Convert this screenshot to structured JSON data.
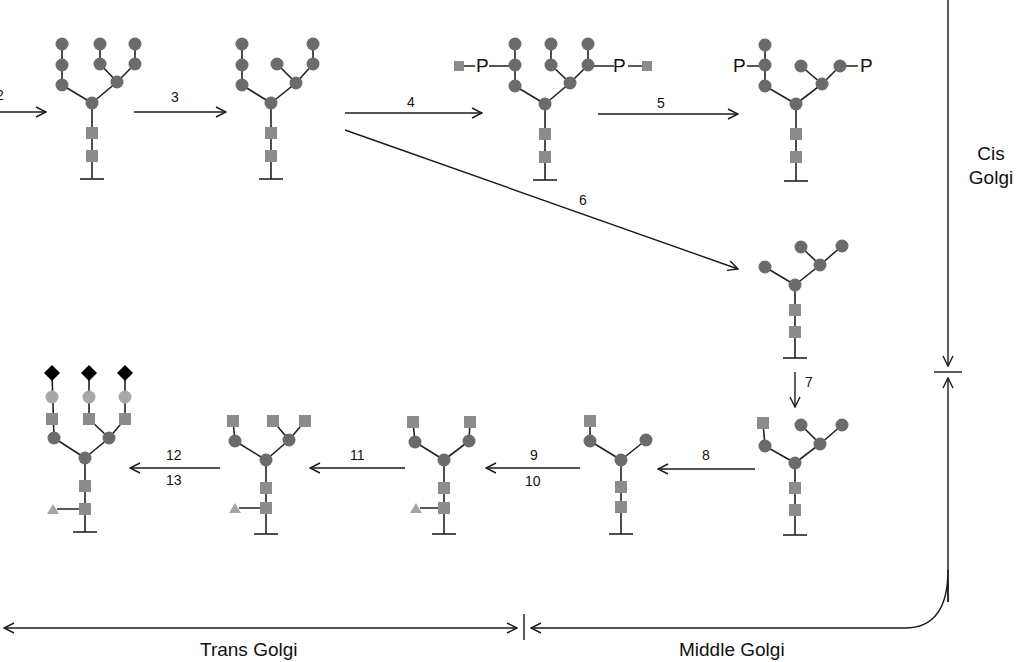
{
  "figure": {
    "colors": {
      "mannose_circle": "#6b6b6b",
      "glcnac_square": "#8c8c8c",
      "galactose_circle_light": "#a8a8a8",
      "sialic_acid_diamond": "#000000",
      "fucose_triangle": "#a5a5a5",
      "line": "#222222"
    }
  },
  "steps": {
    "s2": "2",
    "s3": "3",
    "s4": "4",
    "s5": "5",
    "s6": "6",
    "s7": "7",
    "s8": "8",
    "s9": "9",
    "s10": "10",
    "s11": "11",
    "s12": "12",
    "s13": "13"
  },
  "phosphate_label": "P",
  "regions": {
    "cis_line1": "Cis",
    "cis_line2": "Golgi",
    "middle": "Middle Golgi",
    "trans": "Trans Golgi"
  },
  "structures": [
    {
      "id": "A",
      "description": "high-mannose (Man8) after step 2"
    },
    {
      "id": "B",
      "description": "Man7 after step 3"
    },
    {
      "id": "C",
      "description": "GlcNAc-phosphate added to two mannoses (step 4)"
    },
    {
      "id": "D",
      "description": "mannose-6-phosphate exposed (step 5)"
    },
    {
      "id": "E",
      "description": "Man5 after mannosidase I (step 6)"
    },
    {
      "id": "F",
      "description": "GlcNAc added (step 7)"
    },
    {
      "id": "G",
      "description": "Man3 after mannosidase II (step 8)"
    },
    {
      "id": "H",
      "description": "GlcNAc and fucose added (steps 9, 10)"
    },
    {
      "id": "I",
      "description": "additional GlcNAc (step 11)"
    },
    {
      "id": "J",
      "description": "galactose and sialic acid added (steps 12, 13)"
    }
  ]
}
